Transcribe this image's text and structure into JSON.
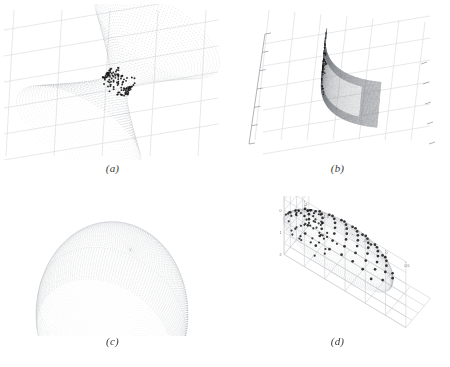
{
  "figure": {
    "background_color": "#ffffff",
    "layout": "2x2 grid of 3D surface plots",
    "panel_count": 4
  },
  "panels": [
    {
      "id": "a",
      "caption": "(a)",
      "surface_type": "hyperboloid-of-one-sheet",
      "description": "Mesh wireframe hourglass surface with scattered black data points clustered at the narrow waist",
      "mesh_color": "#9aa0a6",
      "point_color": "#1a1a1a",
      "grid_color": "#d6d9dc",
      "has_axis_labels": false,
      "point_count": 120
    },
    {
      "id": "b",
      "caption": "(b)",
      "surface_type": "parabolic-sheet",
      "description": "Dark shaded curved quadric sheet seen edge-on with lighter interior facet and background grid",
      "mesh_color": "#6e7378",
      "point_color": "#1a1a1a",
      "grid_color": "#d6d9dc",
      "has_axis_labels": false,
      "point_count": 70
    },
    {
      "id": "c",
      "caption": "(c)",
      "surface_type": "ellipsoid-dome",
      "description": "Dome shaped ellipsoid rendered as concentric ring mesh with dark points along the upper left rim",
      "mesh_color": "#9aa0a6",
      "point_color": "#1a1a1a",
      "grid_color": "#d6d9dc",
      "has_axis_labels": false,
      "point_count": 150
    },
    {
      "id": "d",
      "caption": "(d)",
      "surface_type": "ellipsoid-3d-axes",
      "description": "Tilted ellipsoid of fine dots on a 3D axis box with a lattice of larger dark markers and a dense cluster at the left edge",
      "mesh_color": "#a4a9ae",
      "point_color": "#1a1a1a",
      "grid_color": "#c9ccd0",
      "has_axis_labels": true,
      "point_count": 60,
      "axes": {
        "z_ticks": [
          "1",
          "0.8",
          "0.6",
          "0.4",
          "0.2",
          "0"
        ],
        "y_ticks": [
          "2",
          "1",
          "0",
          "-1"
        ],
        "x_ticks": [
          "-2.5",
          "-2",
          "-1.5",
          "-1",
          "-0.5",
          "0",
          "0.5"
        ]
      }
    }
  ],
  "chart_data": {
    "type": "scatter",
    "title": "",
    "xlabel": "",
    "ylabel": "",
    "subplots": [
      {
        "name": "(a)",
        "type": "scatter",
        "surface": "hyperboloid-of-one-sheet",
        "xlim": [
          -3,
          3
        ],
        "ylim": [
          -3,
          3
        ],
        "zlim": [
          -2,
          2
        ],
        "grid": true,
        "legend": "none",
        "points_note": "dense black cluster at surface waist"
      },
      {
        "name": "(b)",
        "type": "scatter",
        "surface": "parabolic-sheet",
        "xlim": [
          -2,
          2
        ],
        "ylim": [
          -2,
          2
        ],
        "zlim": [
          0,
          4
        ],
        "grid": true,
        "legend": "none",
        "points_note": "points along upper ridge of sheet"
      },
      {
        "name": "(c)",
        "type": "scatter",
        "surface": "ellipsoid-dome",
        "xlim": [
          -1,
          1
        ],
        "ylim": [
          -1,
          1
        ],
        "zlim": [
          0,
          1
        ],
        "grid": false,
        "legend": "none",
        "points_note": "points along upper-left rim of dome"
      },
      {
        "name": "(d)",
        "type": "scatter",
        "surface": "ellipsoid",
        "x": [
          -2.5,
          -2,
          -1.5,
          -1,
          -0.5,
          0,
          0.5
        ],
        "y": [
          -1,
          0,
          1,
          2
        ],
        "z": [
          0,
          0.2,
          0.4,
          0.6,
          0.8,
          1
        ],
        "xlim": [
          -2.8,
          0.8
        ],
        "ylim": [
          -1.5,
          2.5
        ],
        "zlim": [
          0,
          1.05
        ],
        "grid": true,
        "legend": "none",
        "points_note": "regular lattice of markers on ellipsoid plus dense left-edge cluster"
      }
    ]
  }
}
